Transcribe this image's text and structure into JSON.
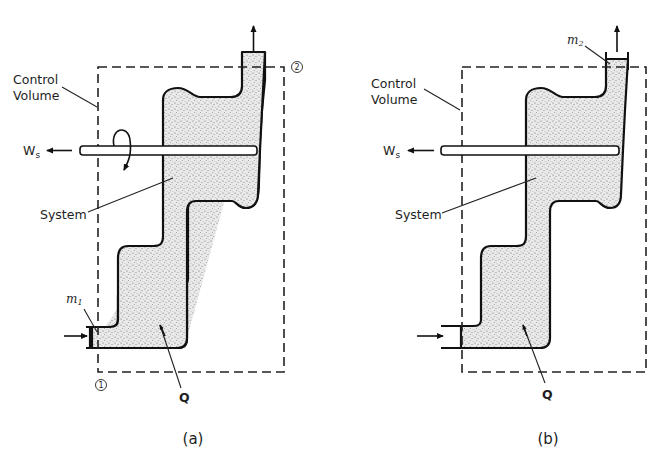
{
  "figure": {
    "panels": [
      {
        "id": "a",
        "caption": "(a)",
        "labels": {
          "control_volume": [
            "Control",
            "Volume"
          ],
          "shaft_work": "W",
          "shaft_work_sub": "s",
          "system": "System",
          "mass_in": "m",
          "mass_in_sub": "1",
          "heat": "Q",
          "station_inlet": "1",
          "station_outlet": "2"
        }
      },
      {
        "id": "b",
        "caption": "(b)",
        "labels": {
          "control_volume": [
            "Control",
            "Volume"
          ],
          "shaft_work": "W",
          "shaft_work_sub": "s",
          "system": "System",
          "mass_out": "m",
          "mass_out_sub": "2",
          "heat": "Q"
        }
      }
    ]
  }
}
